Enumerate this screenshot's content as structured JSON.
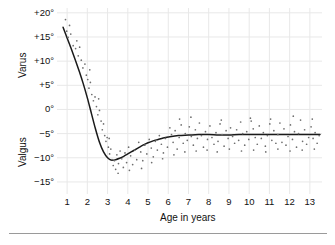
{
  "figure": {
    "y_axis_upper_label": "Varus",
    "y_axis_lower_label": "Valgus",
    "x_axis_label": "Age in years"
  },
  "chart_data": {
    "type": "scatter",
    "title": "",
    "subtitle": "",
    "xlabel": "Age in years",
    "ylabel": "Varus / Valgus",
    "ylabel_upper": "Varus",
    "ylabel_lower": "Valgus",
    "xlim": [
      0.5,
      13.6
    ],
    "ylim": [
      -17.5,
      21.0
    ],
    "grid": true,
    "legend": null,
    "x_ticks": [
      1,
      2,
      3,
      4,
      5,
      6,
      7,
      8,
      9,
      10,
      11,
      12,
      13
    ],
    "x_tick_labels": [
      "1",
      "2",
      "3",
      "4",
      "5",
      "6",
      "7",
      "8",
      "9",
      "10",
      "11",
      "12",
      "13"
    ],
    "y_ticks": [
      20,
      15,
      10,
      5,
      0,
      -5,
      -10,
      -15
    ],
    "y_tick_labels": [
      "+20°",
      "+15°",
      "+10°",
      "+5°",
      "0°",
      "−5°",
      "−10°",
      "−15°"
    ],
    "series": [
      {
        "name": "mean tibiofemoral angle",
        "type": "line",
        "color": "#1a1a1a",
        "x": [
          0.8,
          1.0,
          1.2,
          1.4,
          1.6,
          1.8,
          2.0,
          2.2,
          2.4,
          2.6,
          2.8,
          3.0,
          3.2,
          3.4,
          3.6,
          3.8,
          4.0,
          4.25,
          4.5,
          4.75,
          5.0,
          5.25,
          5.5,
          5.75,
          6.0,
          6.5,
          7.0,
          7.5,
          8.0,
          8.5,
          9.0,
          9.5,
          10.0,
          10.5,
          11.0,
          11.5,
          12.0,
          12.5,
          13.0,
          13.5
        ],
        "y": [
          17.0,
          14.8,
          12.6,
          10.3,
          7.9,
          5.3,
          2.4,
          -0.8,
          -4.0,
          -6.8,
          -8.8,
          -10.0,
          -10.5,
          -10.4,
          -10.1,
          -9.7,
          -9.2,
          -8.6,
          -8.0,
          -7.4,
          -6.9,
          -6.5,
          -6.2,
          -5.9,
          -5.7,
          -5.4,
          -5.3,
          -5.2,
          -5.2,
          -5.3,
          -5.3,
          -5.2,
          -5.2,
          -5.2,
          -5.2,
          -5.2,
          -5.2,
          -5.2,
          -5.2,
          -5.2
        ]
      },
      {
        "name": "individual measurements",
        "type": "scatter",
        "color": "#6e6e6e",
        "points": [
          [
            0.92,
            18.6
          ],
          [
            0.98,
            16.2
          ],
          [
            1.05,
            14.9
          ],
          [
            1.18,
            15.6
          ],
          [
            1.3,
            13.2
          ],
          [
            1.42,
            12.6
          ],
          [
            1.55,
            11.1
          ],
          [
            1.62,
            12.9
          ],
          [
            1.7,
            10.2
          ],
          [
            1.78,
            8.6
          ],
          [
            1.88,
            9.4
          ],
          [
            1.95,
            7.1
          ],
          [
            2.02,
            6.2
          ],
          [
            2.08,
            4.4
          ],
          [
            2.15,
            5.6
          ],
          [
            2.22,
            3.1
          ],
          [
            2.3,
            1.8
          ],
          [
            2.38,
            2.6
          ],
          [
            2.45,
            0.6
          ],
          [
            2.52,
            -1.1
          ],
          [
            2.6,
            -0.2
          ],
          [
            2.68,
            -2.4
          ],
          [
            2.74,
            -4.2
          ],
          [
            2.8,
            -3.0
          ],
          [
            2.86,
            -5.4
          ],
          [
            2.92,
            -6.6
          ],
          [
            2.98,
            -5.8
          ],
          [
            3.04,
            -7.8
          ],
          [
            3.1,
            -9.2
          ],
          [
            3.16,
            -8.2
          ],
          [
            3.22,
            -10.4
          ],
          [
            3.28,
            -11.6
          ],
          [
            3.34,
            -10.6
          ],
          [
            3.4,
            -12.4
          ],
          [
            3.46,
            -9.4
          ],
          [
            3.54,
            -11.2
          ],
          [
            3.62,
            -8.6
          ],
          [
            3.7,
            -10.2
          ],
          [
            3.78,
            -12.0
          ],
          [
            3.86,
            -9.0
          ],
          [
            3.94,
            -11.0
          ],
          [
            4.04,
            -7.8
          ],
          [
            4.14,
            -9.6
          ],
          [
            4.24,
            -11.4
          ],
          [
            4.34,
            -8.4
          ],
          [
            4.44,
            -10.4
          ],
          [
            4.54,
            -6.8
          ],
          [
            4.64,
            -8.8
          ],
          [
            4.74,
            -10.6
          ],
          [
            4.84,
            -7.4
          ],
          [
            4.94,
            -9.2
          ],
          [
            5.06,
            -6.2
          ],
          [
            5.16,
            -8.0
          ],
          [
            5.26,
            -9.8
          ],
          [
            5.36,
            -6.6
          ],
          [
            5.46,
            -8.4
          ],
          [
            5.56,
            -5.4
          ],
          [
            5.66,
            -7.2
          ],
          [
            5.76,
            -9.0
          ],
          [
            5.86,
            -6.0
          ],
          [
            5.96,
            -7.8
          ],
          [
            6.08,
            -3.8
          ],
          [
            6.16,
            -5.2
          ],
          [
            6.24,
            -6.8
          ],
          [
            6.34,
            -4.4
          ],
          [
            6.44,
            -8.2
          ],
          [
            6.54,
            -5.8
          ],
          [
            6.64,
            -3.2
          ],
          [
            6.74,
            -7.0
          ],
          [
            6.84,
            -5.0
          ],
          [
            6.94,
            -6.4
          ],
          [
            7.04,
            -3.6
          ],
          [
            7.14,
            -5.6
          ],
          [
            7.24,
            -7.4
          ],
          [
            7.34,
            -4.2
          ],
          [
            7.44,
            -6.0
          ],
          [
            7.54,
            -2.8
          ],
          [
            7.64,
            -5.4
          ],
          [
            7.74,
            -7.8
          ],
          [
            7.84,
            -4.6
          ],
          [
            7.94,
            -6.2
          ],
          [
            8.06,
            -3.4
          ],
          [
            8.16,
            -5.8
          ],
          [
            8.26,
            -7.2
          ],
          [
            8.36,
            -4.8
          ],
          [
            8.46,
            -6.6
          ],
          [
            8.56,
            -3.0
          ],
          [
            8.66,
            -5.2
          ],
          [
            8.76,
            -7.6
          ],
          [
            8.86,
            -4.4
          ],
          [
            8.96,
            -6.0
          ],
          [
            9.08,
            -3.8
          ],
          [
            9.18,
            -5.6
          ],
          [
            9.28,
            -7.0
          ],
          [
            9.38,
            -4.2
          ],
          [
            9.48,
            -6.4
          ],
          [
            9.58,
            -2.6
          ],
          [
            9.68,
            -5.0
          ],
          [
            9.78,
            -7.4
          ],
          [
            9.88,
            -4.6
          ],
          [
            9.98,
            -6.2
          ],
          [
            10.1,
            -2.4
          ],
          [
            10.2,
            -4.0
          ],
          [
            10.3,
            -5.8
          ],
          [
            10.4,
            -7.2
          ],
          [
            10.5,
            -3.4
          ],
          [
            10.6,
            -6.0
          ],
          [
            10.7,
            -4.8
          ],
          [
            10.8,
            -7.6
          ],
          [
            10.9,
            -5.4
          ],
          [
            11.02,
            -3.0
          ],
          [
            11.12,
            -6.4
          ],
          [
            11.22,
            -4.4
          ],
          [
            11.32,
            -7.0
          ],
          [
            11.42,
            -5.2
          ],
          [
            11.52,
            -2.8
          ],
          [
            11.62,
            -6.8
          ],
          [
            11.72,
            -4.0
          ],
          [
            11.82,
            -7.4
          ],
          [
            11.92,
            -5.6
          ],
          [
            12.04,
            -3.2
          ],
          [
            12.14,
            -6.2
          ],
          [
            12.24,
            -4.6
          ],
          [
            12.34,
            -7.8
          ],
          [
            12.44,
            -5.0
          ],
          [
            12.54,
            -2.2
          ],
          [
            12.64,
            -6.6
          ],
          [
            12.74,
            -4.2
          ],
          [
            12.84,
            -7.2
          ],
          [
            12.94,
            -5.8
          ],
          [
            13.06,
            -3.6
          ],
          [
            13.16,
            -6.0
          ],
          [
            13.26,
            -4.8
          ],
          [
            13.36,
            -7.0
          ],
          [
            13.46,
            -5.4
          ],
          [
            1.12,
            17.4
          ],
          [
            1.48,
            14.2
          ],
          [
            2.12,
            8.2
          ],
          [
            2.56,
            2.2
          ],
          [
            3.08,
            -6.0
          ],
          [
            3.52,
            -13.2
          ],
          [
            4.08,
            -12.6
          ],
          [
            4.68,
            -12.2
          ],
          [
            5.18,
            -11.0
          ],
          [
            5.72,
            -10.2
          ],
          [
            6.28,
            -9.4
          ],
          [
            6.82,
            -8.8
          ],
          [
            7.38,
            -8.6
          ],
          [
            7.92,
            -8.4
          ],
          [
            8.42,
            -8.8
          ],
          [
            9.02,
            -8.2
          ],
          [
            9.62,
            -8.6
          ],
          [
            10.22,
            -8.4
          ],
          [
            10.82,
            -8.8
          ],
          [
            11.42,
            -8.2
          ],
          [
            12.02,
            -8.6
          ],
          [
            12.62,
            -8.4
          ],
          [
            13.22,
            -8.2
          ],
          [
            6.56,
            -2.0
          ],
          [
            7.12,
            -1.6
          ],
          [
            8.62,
            -2.2
          ],
          [
            10.06,
            -1.8
          ],
          [
            11.06,
            -2.0
          ],
          [
            12.18,
            -1.4
          ],
          [
            13.12,
            -2.0
          ]
        ]
      }
    ]
  }
}
